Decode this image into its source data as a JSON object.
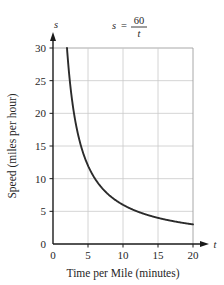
{
  "chart_data": {
    "type": "line",
    "title": "",
    "equation_label": {
      "lhs": "s",
      "equals": "=",
      "numerator": "60",
      "denominator": "t"
    },
    "xlabel": "Time per Mile (minutes)",
    "ylabel": "Speed (miles per hour)",
    "x_axis_variable": "t",
    "y_axis_variable": "s",
    "xlim": [
      0,
      20
    ],
    "ylim": [
      0,
      30
    ],
    "xticks": [
      0,
      5,
      10,
      15,
      20
    ],
    "yticks": [
      0,
      5,
      10,
      15,
      20,
      25,
      30
    ],
    "xtick_labels": [
      "0",
      "5",
      "10",
      "15",
      "20"
    ],
    "ytick_labels": [
      "0",
      "5",
      "10",
      "15",
      "20",
      "25",
      "30"
    ],
    "grid": true,
    "legend": "none",
    "series": [
      {
        "name": "s = 60/t",
        "formula": "s = 60 / t",
        "x_start": 2,
        "x_end": 20,
        "x": [
          2,
          2.5,
          3,
          3.5,
          4,
          4.5,
          5,
          5.5,
          6,
          6.5,
          7,
          7.5,
          8,
          9,
          10,
          11,
          12,
          13,
          14,
          15,
          16,
          17,
          18,
          19,
          20
        ],
        "values": [
          30,
          24,
          20,
          17.14,
          15,
          13.33,
          12,
          10.91,
          10,
          9.23,
          8.57,
          8,
          7.5,
          6.67,
          6,
          5.45,
          5,
          4.62,
          4.29,
          4,
          3.75,
          3.53,
          3.33,
          3.16,
          3
        ]
      }
    ]
  },
  "style": {
    "curve_color": "#2b2b2b",
    "grid_color": "#c9c9c9",
    "axis_color": "#1a1a1a",
    "background": "#ffffff"
  }
}
